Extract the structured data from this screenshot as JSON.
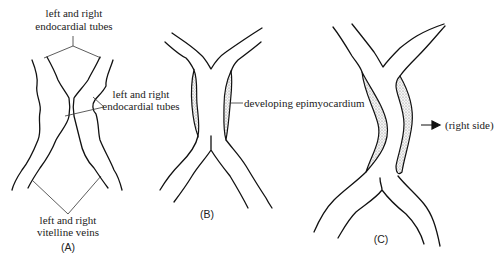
{
  "figure": {
    "panels": [
      {
        "id": "A",
        "caption": "(A)",
        "labels": {
          "top": [
            "left and right",
            "endocardial tubes"
          ],
          "middle": [
            "left and right",
            "endocardial tubes"
          ],
          "bottom": [
            "left and right",
            "vitelline veins"
          ]
        }
      },
      {
        "id": "B",
        "caption": "(B)",
        "labels": {
          "side": "developing epimyocardium"
        }
      },
      {
        "id": "C",
        "caption": "(C)",
        "labels": {
          "side": "(right side)"
        },
        "arrow": "right-arrow"
      }
    ]
  }
}
